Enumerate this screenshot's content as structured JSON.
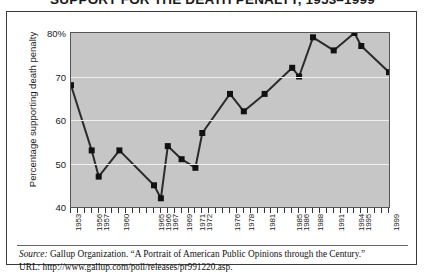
{
  "title": "SUPPORT FOR THE DEATH PENALTY, 1953–1999",
  "footnote": {
    "source_label": "Source:",
    "source_text": " Gallup Organization. “A Portrait of American Public Opinions through the Century.”",
    "url_text": "URL: http://www.gallup.com/poll/releases/pr991220.asp."
  },
  "style": {
    "panel_color": "#c6c6c6",
    "line_color": "#2b2b2b",
    "marker_color": "#111111",
    "grid_color": "#eeeeee",
    "frame_color": "#3a3a3a"
  },
  "chart_data": {
    "type": "line",
    "title": "SUPPORT FOR THE DEATH PENALTY, 1953–1999",
    "xlabel": "",
    "ylabel": "Percentage supporting death penalty",
    "ylim": [
      40,
      80
    ],
    "yticks": [
      40,
      50,
      60,
      70,
      80
    ],
    "ytick_labels": [
      "40",
      "50",
      "60",
      "70",
      "80%"
    ],
    "grid": true,
    "legend": "none",
    "xlim": [
      1953,
      1999
    ],
    "x": [
      1953,
      1956,
      1957,
      1960,
      1965,
      1966,
      1967,
      1969,
      1971,
      1972,
      1976,
      1978,
      1981,
      1985,
      1986,
      1988,
      1991,
      1994,
      1995,
      1999
    ],
    "xtick_labels": [
      "1953",
      "1956",
      "1957",
      "1960",
      "1965",
      "1966",
      "1967",
      "1969",
      "1971",
      "1972",
      "1976",
      "1978",
      "1981",
      "1985",
      "1986",
      "1988",
      "1991",
      "1994",
      "1995",
      "1999"
    ],
    "values": [
      68,
      53,
      47,
      53,
      45,
      42,
      54,
      51,
      49,
      57,
      66,
      62,
      66,
      72,
      70,
      79,
      76,
      80,
      77,
      71
    ],
    "series": [
      {
        "name": "Percentage supporting death penalty",
        "values": [
          68,
          53,
          47,
          53,
          45,
          42,
          54,
          51,
          49,
          57,
          66,
          62,
          66,
          72,
          70,
          79,
          76,
          80,
          77,
          71
        ]
      }
    ],
    "minor_xticks_count": 47
  }
}
